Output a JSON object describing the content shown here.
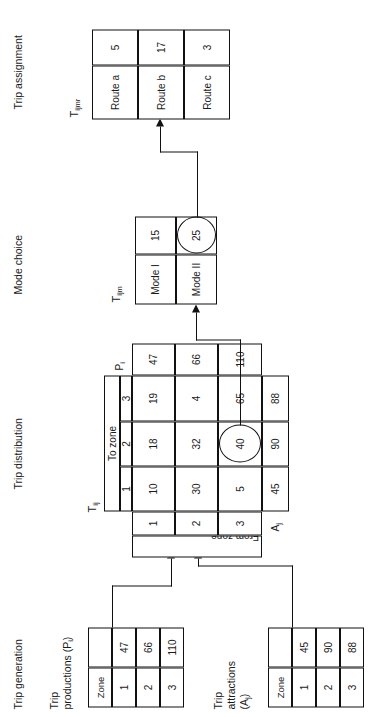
{
  "figure": {
    "orientation": "rotated-90-ccw"
  },
  "sections": [
    {
      "id": "trip-generation",
      "label": "Trip generation"
    },
    {
      "id": "trip-distribution",
      "label": "Trip distribution"
    },
    {
      "id": "mode-choice",
      "label": "Mode choice"
    },
    {
      "id": "trip-assignment",
      "label": "Trip assignment"
    }
  ],
  "trip_productions": {
    "caption_line1": "Trip",
    "caption_line2": "productions (P",
    "caption_sub": "i",
    "caption_close": ")",
    "header": "Zone",
    "rows": [
      {
        "zone": "1",
        "value": "47"
      },
      {
        "zone": "2",
        "value": "66"
      },
      {
        "zone": "3",
        "value": "110"
      }
    ]
  },
  "trip_attractions": {
    "caption_line1": "Trip",
    "caption_line2": "attractions",
    "caption_line3_open": "(A",
    "caption_sub": "j",
    "caption_close": ")",
    "header": "Zone",
    "rows": [
      {
        "zone": "1",
        "value": "45"
      },
      {
        "zone": "2",
        "value": "90"
      },
      {
        "zone": "3",
        "value": "88"
      }
    ]
  },
  "trip_distribution": {
    "matrix_label": "T",
    "matrix_label_sub": "ij",
    "row_axis_label": "From zone",
    "col_axis_label": "To zone",
    "row_headers": [
      "1",
      "2",
      "3"
    ],
    "col_headers": [
      "1",
      "2",
      "3"
    ],
    "pi_label": "P",
    "pi_label_sub": "i",
    "aj_label": "A",
    "aj_label_sub": "j",
    "cells": [
      [
        "10",
        "18",
        "19"
      ],
      [
        "30",
        "32",
        "4"
      ],
      [
        "5",
        "40",
        "65"
      ]
    ],
    "row_totals": [
      "47",
      "66",
      "110"
    ],
    "col_totals": [
      "45",
      "90",
      "88"
    ],
    "highlighted_cell": {
      "row": 2,
      "col": 1,
      "value": "40"
    }
  },
  "mode_choice": {
    "label": "T",
    "label_sub": "ijm",
    "rows": [
      {
        "mode": "Mode I",
        "value": "15"
      },
      {
        "mode": "Mode II",
        "value": "25"
      }
    ],
    "highlighted_row": 1
  },
  "trip_assignment": {
    "label": "T",
    "label_sub": "ijmr",
    "rows": [
      {
        "route": "Route a",
        "value": "5"
      },
      {
        "route": "Route b",
        "value": "17"
      },
      {
        "route": "Route c",
        "value": "3"
      }
    ]
  },
  "colors": {
    "ink": "#111111",
    "paper": "#ffffff"
  }
}
